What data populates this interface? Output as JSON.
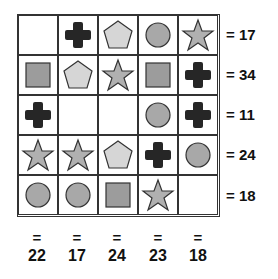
{
  "puzzle": {
    "grid": [
      [
        "empty",
        "cross",
        "pentagon",
        "circle",
        "star"
      ],
      [
        "square",
        "pentagon",
        "star",
        "square",
        "cross"
      ],
      [
        "cross",
        "empty",
        "empty",
        "circle",
        "cross"
      ],
      [
        "star",
        "star",
        "pentagon",
        "cross",
        "circle"
      ],
      [
        "circle",
        "circle",
        "square",
        "star",
        "empty"
      ]
    ],
    "row_sums": [
      "= 17",
      "= 34",
      "= 11",
      "= 24",
      "= 18"
    ],
    "col_sums": [
      "22",
      "17",
      "24",
      "23",
      "18"
    ],
    "equals_sign": "="
  },
  "colors": {
    "cross": "#262626",
    "pentagon": "#d6d6d6",
    "circle": "#a8a8a8",
    "star": "#b0b0b0",
    "square": "#9c9c9c",
    "stroke": "#333333"
  }
}
